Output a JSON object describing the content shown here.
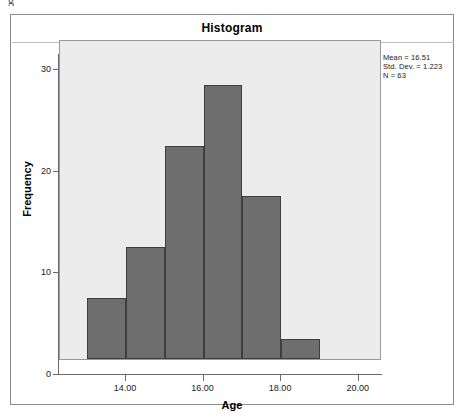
{
  "artifact": {
    "glyph": "g"
  },
  "chart_data": {
    "type": "bar",
    "title": "Histogram",
    "xlabel": "Age",
    "ylabel": "Frequency",
    "categories": [
      "13.5",
      "14.5",
      "15.5",
      "16.5",
      "17.5",
      "18.5"
    ],
    "bin_edges": [
      13.0,
      14.0,
      15.0,
      16.0,
      17.0,
      18.0,
      19.0
    ],
    "values": [
      6,
      11,
      21,
      27,
      16,
      2
    ],
    "xlim": [
      12.3,
      20.6
    ],
    "ylim": [
      0,
      31.5
    ],
    "x_ticks": [
      14.0,
      16.0,
      18.0,
      20.0
    ],
    "x_tick_labels": [
      "14.00",
      "16.00",
      "18.00",
      "20.00"
    ],
    "y_ticks": [
      0,
      10,
      20,
      30
    ],
    "y_tick_labels": [
      "0",
      "10",
      "20",
      "30"
    ],
    "grid": false,
    "legend": null,
    "bar_color": "#6e6e6e",
    "bar_edge_color": "#3e3e3e",
    "plot_background": "#ececec",
    "annotations": {
      "mean": "Mean = 16.51",
      "std_dev": "Std. Dev. = 1.223",
      "n": "N = 63"
    }
  }
}
